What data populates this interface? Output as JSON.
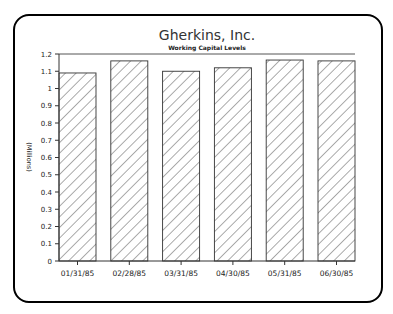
{
  "chart_data": {
    "type": "bar",
    "title": "Gherkins, Inc.",
    "subtitle": "Working Capital Levels",
    "xlabel": "",
    "ylabel": "(Millions)",
    "categories": [
      "01/31/85",
      "02/28/85",
      "03/31/85",
      "04/30/85",
      "05/31/85",
      "06/30/85"
    ],
    "values": [
      1.09,
      1.16,
      1.1,
      1.12,
      1.165,
      1.16
    ],
    "ylim": [
      0,
      1.2
    ],
    "yticks": [
      "0",
      "0.1",
      "0.2",
      "0.3",
      "0.4",
      "0.5",
      "0.6",
      "0.7",
      "0.8",
      "0.9",
      "1",
      "1.1",
      "1.2"
    ],
    "grid": false,
    "legend": null,
    "fill_pattern": "diagonal-hatch",
    "colors": {
      "frame": "#000000",
      "bar_outline": "#333333",
      "hatch": "#444444"
    }
  }
}
